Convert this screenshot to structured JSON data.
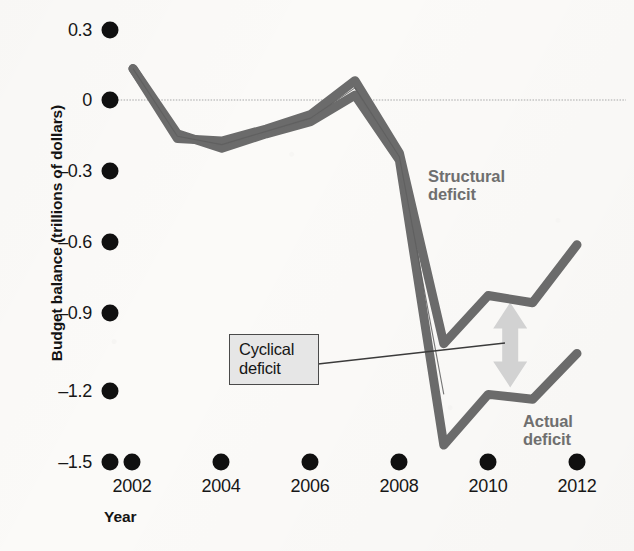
{
  "axes": {
    "y_title": "Budget balance (trillions of dollars)",
    "x_title": "Year",
    "y_ticks": [
      "0.3",
      "0",
      "–0.3",
      "–0.6",
      "–0.9",
      "–1.2",
      "–1.5"
    ],
    "x_ticks": [
      "2002",
      "2004",
      "2006",
      "2008",
      "2010",
      "2012"
    ]
  },
  "annotations": {
    "structural_line1": "Structural",
    "structural_line2": "deficit",
    "actual_line1": "Actual",
    "actual_line2": "deficit",
    "cyclical_line1": "Cyclical",
    "cyclical_line2": "deficit"
  },
  "colors": {
    "line": "#6b6b6b",
    "zero_line": "#c2c2c2",
    "arrow": "#d2d2d2",
    "callout_fill": "#e6e6e6",
    "callout_border": "#4a4a4a",
    "annotation_text": "#6f6f6f",
    "tick_dot": "#101010"
  },
  "chart_data": {
    "type": "line",
    "title": "",
    "xlabel": "Year",
    "ylabel": "Budget balance (trillions of dollars)",
    "xlim": [
      2002,
      2012
    ],
    "ylim": [
      -1.5,
      0.3
    ],
    "ytick_values": [
      0.3,
      0,
      -0.3,
      -0.6,
      -0.9,
      -1.2,
      -1.5
    ],
    "xtick_values": [
      2002,
      2004,
      2006,
      2008,
      2010,
      2012
    ],
    "grid": false,
    "legend": "inline-annotations",
    "zero_reference_line": 0,
    "x": [
      2002,
      2003,
      2004,
      2005,
      2006,
      2007,
      2008,
      2009,
      2010,
      2011,
      2012
    ],
    "series": [
      {
        "name": "Structural deficit",
        "values": [
          0.13,
          -0.16,
          -0.17,
          -0.12,
          -0.06,
          0.08,
          -0.22,
          -1.01,
          -0.81,
          -0.84,
          -0.6
        ]
      },
      {
        "name": "Actual deficit",
        "values": [
          0.13,
          -0.14,
          -0.2,
          -0.14,
          -0.09,
          0.02,
          -0.25,
          -1.43,
          -1.22,
          -1.24,
          -1.05
        ]
      }
    ],
    "annotations": [
      {
        "text": "Cyclical deficit",
        "description": "double-headed arrow showing the gap between the structural and actual deficit lines at 2010",
        "at_x": 2010,
        "span_y": [
          -1.22,
          -0.81
        ]
      }
    ]
  }
}
